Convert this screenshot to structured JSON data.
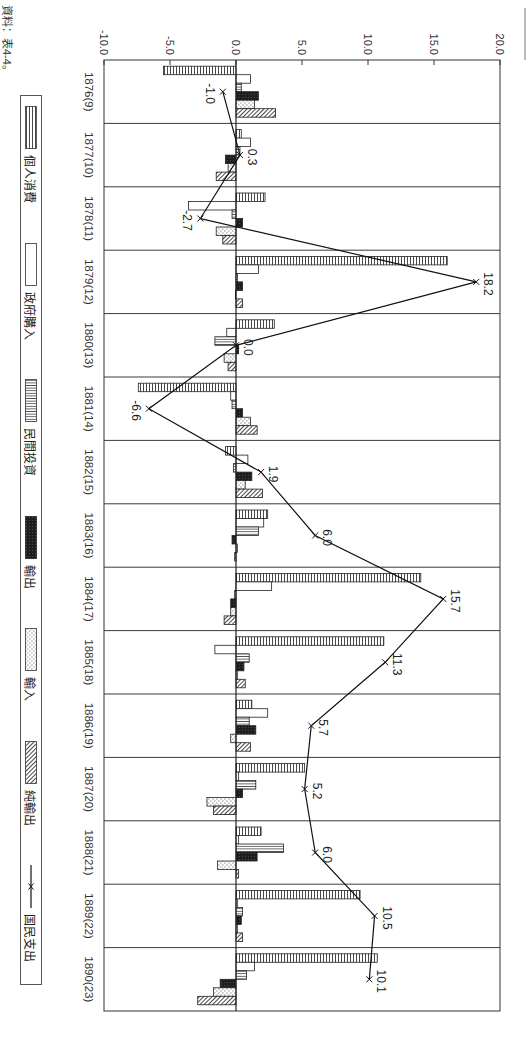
{
  "chart_data": {
    "type": "bar",
    "title": "",
    "xlabel": "",
    "ylabel": "",
    "orientation": "rotated 90 degrees clockwise (years run top-to-bottom, values left-to-right)",
    "ylim": [
      -10,
      20
    ],
    "yticks": [
      -10,
      -5,
      0,
      5,
      10,
      15,
      20
    ],
    "ytick_labels": [
      "-10.0",
      "-5.0",
      "0.0",
      "5.0",
      "10.0",
      "15.0",
      "20.0"
    ],
    "grid": false,
    "category_separators": true,
    "legend_position": "bottom",
    "categories": [
      "1876(9)",
      "1877(10)",
      "1878(11)",
      "1879(12)",
      "1880(13)",
      "1881(14)",
      "1882(15)",
      "1883(16)",
      "1884(17)",
      "1885(18)",
      "1886(19)",
      "1887(20)",
      "1888(21)",
      "1889(22)",
      "1890(23)"
    ],
    "series": [
      {
        "name": "個人消費",
        "type": "bar",
        "pattern": "horizontal-lines",
        "values": [
          -5.5,
          0.4,
          2.2,
          16.0,
          2.9,
          -7.4,
          -0.8,
          2.4,
          14.0,
          11.2,
          1.2,
          5.2,
          1.9,
          9.4,
          10.7
        ]
      },
      {
        "name": "政府購入",
        "type": "bar",
        "pattern": "white",
        "values": [
          1.1,
          1.1,
          -3.6,
          1.7,
          -0.7,
          -0.4,
          0.9,
          2.1,
          2.7,
          -1.6,
          2.4,
          0.2,
          0.2,
          0.1,
          1.4
        ]
      },
      {
        "name": "民間投資",
        "type": "bar",
        "pattern": "vertical-lines",
        "values": [
          0.4,
          0.3,
          -0.3,
          0.1,
          -1.6,
          -0.3,
          -0.2,
          1.7,
          -0.1,
          1.0,
          1.0,
          1.5,
          3.6,
          0.5,
          0.8
        ]
      },
      {
        "name": "輸出",
        "type": "bar",
        "pattern": "black",
        "values": [
          1.7,
          -0.8,
          0.5,
          0.5,
          0.2,
          0.5,
          1.2,
          -0.3,
          -0.4,
          0.6,
          1.5,
          0.5,
          1.6,
          0.4,
          -1.2
        ]
      },
      {
        "name": "輸入",
        "type": "bar",
        "pattern": "dots",
        "values": [
          1.4,
          -0.6,
          -1.5,
          0.0,
          -0.9,
          1.1,
          0.7,
          0.1,
          -0.4,
          0.1,
          -0.4,
          -2.2,
          -1.4,
          0.1,
          -1.7
        ]
      },
      {
        "name": "純輸出",
        "type": "bar",
        "pattern": "diagonal-hatch",
        "values": [
          3.0,
          -1.5,
          -1.0,
          0.5,
          -0.6,
          1.6,
          2.0,
          -0.1,
          -0.9,
          0.7,
          1.1,
          -1.7,
          0.2,
          0.5,
          -2.9
        ]
      },
      {
        "name": "国民支出",
        "type": "line",
        "marker": "x",
        "values": [
          -1.0,
          0.3,
          -2.7,
          18.2,
          0.0,
          -6.6,
          1.9,
          6.0,
          15.7,
          11.3,
          5.7,
          5.2,
          6.0,
          10.5,
          10.1
        ],
        "data_labels": [
          "-1.0",
          "0.3",
          "-2.7",
          "18.2",
          "0.0",
          "-6.6",
          "1.9",
          "6.0",
          "15.7",
          "11.3",
          "5.7",
          "5.2",
          "6.0",
          "10.5",
          "10.1"
        ]
      }
    ],
    "source": "資料：表4-4。"
  }
}
